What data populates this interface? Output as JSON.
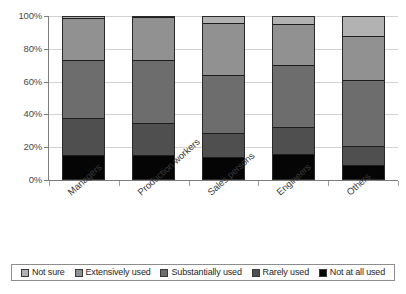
{
  "chart_data": {
    "type": "bar",
    "subtype": "stacked-bar-100-percent",
    "title": "",
    "xlabel": "",
    "ylabel": "",
    "ylim": [
      0,
      100
    ],
    "ytick_labels": [
      "0%",
      "20%",
      "40%",
      "60%",
      "80%",
      "100%"
    ],
    "ytick_values": [
      0,
      20,
      40,
      60,
      80,
      100
    ],
    "grid": true,
    "legend_position": "bottom",
    "categories": [
      "Managers",
      "Production workers",
      "Sales persons",
      "Engineers",
      "Others"
    ],
    "series": [
      {
        "name": "Not at all used",
        "color": "#050505",
        "values": [
          15,
          15,
          14,
          16,
          9
        ]
      },
      {
        "name": "Rarely used",
        "color": "#4f4f4f",
        "values": [
          23,
          19.5,
          14.5,
          16.5,
          12
        ]
      },
      {
        "name": "Substantially used",
        "color": "#6d6d6d",
        "values": [
          35,
          38.5,
          35.5,
          37.5,
          40
        ]
      },
      {
        "name": "Extensively used",
        "color": "#919191",
        "values": [
          26,
          26.5,
          31.5,
          25,
          27
        ]
      },
      {
        "name": "Not sure",
        "color": "#b2b2b2",
        "values": [
          1,
          0.5,
          4.5,
          5,
          12
        ]
      }
    ]
  },
  "legend": {
    "items": [
      {
        "label": "Not sure",
        "color": "#b2b2b2"
      },
      {
        "label": "Extensively used",
        "color": "#919191"
      },
      {
        "label": "Substantially used",
        "color": "#6d6d6d"
      },
      {
        "label": "Rarely used",
        "color": "#4f4f4f"
      },
      {
        "label": "Not at all used",
        "color": "#050505"
      }
    ]
  }
}
